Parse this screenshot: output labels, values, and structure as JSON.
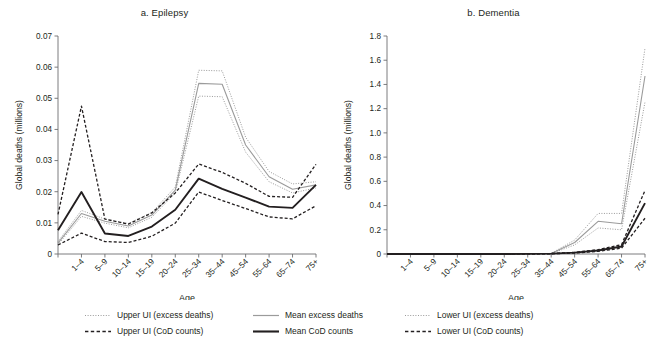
{
  "figure": {
    "ylabel": "Global deaths (millions)",
    "xlabel": "Age"
  },
  "legend": {
    "items": [
      {
        "label": "Upper UI (excess deaths)",
        "style": "dotted",
        "color": "#9b9b9b"
      },
      {
        "label": "Mean excess deaths",
        "style": "solid",
        "color": "#9b9b9b"
      },
      {
        "label": "Lower UI (excess deaths)",
        "style": "dotted",
        "color": "#9b9b9b"
      },
      {
        "label": "Upper UI (CoD counts)",
        "style": "dashed",
        "color": "#231f20"
      },
      {
        "label": "Mean CoD counts",
        "style": "solid-bold",
        "color": "#231f20"
      },
      {
        "label": "Lower UI (CoD counts)",
        "style": "dashed",
        "color": "#231f20"
      }
    ]
  },
  "chart_data": [
    {
      "type": "line",
      "title": "a. Epilepsy",
      "xlabel": "Age",
      "ylabel": "Global deaths (millions)",
      "categories": [
        "<1",
        "1–4",
        "5–9",
        "10–14",
        "15–19",
        "20–24",
        "25–34",
        "35–44",
        "45–54",
        "55–64",
        "65–74",
        "75+"
      ],
      "tick_labels": [
        "",
        "1–4",
        "5–9",
        "10–14",
        "15–19",
        "20–24",
        "25–34",
        "35–44",
        "45–54",
        "55–64",
        "65–74",
        "75+"
      ],
      "ylim": [
        0,
        0.07
      ],
      "yticks": [
        0,
        0.01,
        0.02,
        0.03,
        0.04,
        0.05,
        0.06,
        0.07
      ],
      "ytick_labels": [
        "0",
        "0.01",
        "0.02",
        "0.03",
        "0.04",
        "0.05",
        "0.06",
        "0.07"
      ],
      "grid": false,
      "legend_position": "below-figure",
      "series": [
        {
          "name": "Upper UI (excess deaths)",
          "color": "#9b9b9b",
          "style": "dotted",
          "values": [
            0.004,
            0.014,
            0.0112,
            0.0098,
            0.0133,
            0.0215,
            0.059,
            0.0588,
            0.0375,
            0.0265,
            0.0225,
            0.0232
          ]
        },
        {
          "name": "Mean excess deaths",
          "color": "#9b9b9b",
          "style": "solid",
          "values": [
            0.0035,
            0.013,
            0.0105,
            0.009,
            0.0125,
            0.0205,
            0.0548,
            0.0545,
            0.035,
            0.0248,
            0.0208,
            0.0222
          ]
        },
        {
          "name": "Lower UI (excess deaths)",
          "color": "#9b9b9b",
          "style": "dotted",
          "values": [
            0.003,
            0.0121,
            0.0099,
            0.0084,
            0.0118,
            0.0196,
            0.0507,
            0.0505,
            0.0327,
            0.0232,
            0.0196,
            0.0212
          ]
        },
        {
          "name": "Upper UI (CoD counts)",
          "color": "#231f20",
          "style": "dashed",
          "values": [
            0.0127,
            0.0475,
            0.0112,
            0.0096,
            0.0132,
            0.0196,
            0.0289,
            0.0262,
            0.0227,
            0.0185,
            0.0182,
            0.0288
          ]
        },
        {
          "name": "Mean CoD counts",
          "color": "#231f20",
          "style": "solid-bold",
          "values": [
            0.0076,
            0.0199,
            0.0066,
            0.0058,
            0.0088,
            0.0142,
            0.0242,
            0.0209,
            0.0181,
            0.0152,
            0.0148,
            0.0222
          ]
        },
        {
          "name": "Lower UI (CoD counts)",
          "color": "#231f20",
          "style": "dashed",
          "values": [
            0.0029,
            0.0067,
            0.004,
            0.0037,
            0.0057,
            0.0099,
            0.0199,
            0.0172,
            0.0146,
            0.0119,
            0.0113,
            0.0155
          ]
        }
      ]
    },
    {
      "type": "line",
      "title": "b. Dementia",
      "xlabel": "Age",
      "ylabel": "Global deaths (millions)",
      "categories": [
        "<1",
        "1–4",
        "5–9",
        "10–14",
        "15–19",
        "20–24",
        "25–34",
        "35–44",
        "45–54",
        "55–64",
        "65–74",
        "75+"
      ],
      "tick_labels": [
        "",
        "1–4",
        "5–9",
        "10–14",
        "15–19",
        "20–24",
        "25–34",
        "35–44",
        "45–54",
        "55–64",
        "65–74",
        "75+"
      ],
      "ylim": [
        0,
        1.8
      ],
      "yticks": [
        0,
        0.2,
        0.4,
        0.6,
        0.8,
        1.0,
        1.2,
        1.4,
        1.6,
        1.8
      ],
      "ytick_labels": [
        "0",
        "0.2",
        "0.4",
        "0.6",
        "0.8",
        "1.0",
        "1.2",
        "1.4",
        "1.6",
        "1.8"
      ],
      "grid": false,
      "legend_position": "below-figure",
      "series": [
        {
          "name": "Upper UI (excess deaths)",
          "color": "#9b9b9b",
          "style": "dotted",
          "values": [
            0,
            0,
            0,
            0,
            0,
            0,
            0,
            0.005,
            0.115,
            0.335,
            0.335,
            1.7
          ]
        },
        {
          "name": "Mean excess deaths",
          "color": "#9b9b9b",
          "style": "solid",
          "values": [
            0,
            0,
            0,
            0,
            0,
            0,
            0,
            0.004,
            0.095,
            0.27,
            0.25,
            1.47
          ]
        },
        {
          "name": "Lower UI (excess deaths)",
          "color": "#9b9b9b",
          "style": "dotted",
          "values": [
            0,
            0,
            0,
            0,
            0,
            0,
            0,
            0.003,
            0.075,
            0.215,
            0.2,
            1.255
          ]
        },
        {
          "name": "Upper UI (CoD counts)",
          "color": "#231f20",
          "style": "dashed",
          "values": [
            0,
            0,
            0,
            0,
            0,
            0,
            0.001,
            0.004,
            0.014,
            0.036,
            0.077,
            0.525
          ]
        },
        {
          "name": "Mean CoD counts",
          "color": "#231f20",
          "style": "solid-bold",
          "values": [
            0,
            0,
            0,
            0,
            0,
            0,
            0.001,
            0.003,
            0.011,
            0.029,
            0.062,
            0.42
          ]
        },
        {
          "name": "Lower UI (CoD counts)",
          "color": "#231f20",
          "style": "dashed",
          "values": [
            0,
            0,
            0,
            0,
            0,
            0,
            0.001,
            0.002,
            0.008,
            0.022,
            0.048,
            0.295
          ]
        }
      ]
    }
  ]
}
